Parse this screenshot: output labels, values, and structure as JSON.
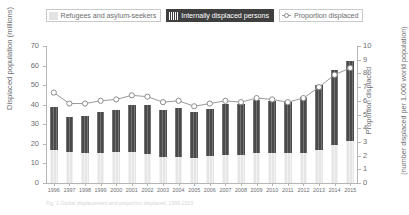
{
  "legend": {
    "items": [
      {
        "label": "Refugees and asylum-seekers",
        "style": "light",
        "swatch": "legend-swatch-refugees"
      },
      {
        "label": "Internally displaced persons",
        "style": "dark",
        "swatch": "legend-swatch-idp"
      },
      {
        "label": "Proportion displaced",
        "style": "line",
        "swatch": "legend-swatch-proportion"
      }
    ]
  },
  "colors": {
    "bar_dark": "#4a4a4a",
    "bar_light": "#e6e6e6",
    "line": "#9a9a9a",
    "marker_fill": "#ffffff",
    "marker_stroke": "#8c8c8c",
    "axis": "#b5b5b5",
    "text": "#6d6e71"
  },
  "caption": "Fig. 1 Global displacement and proportion displaced, 1996-2015",
  "chart_data": {
    "type": "bar",
    "title": "",
    "subtitle": "",
    "xlabel": "",
    "ylabel": "Displaced population  (millions)",
    "y2label_line1": "Proportion displaced",
    "y2label_line2": "(number displaced per 1,000 world population)",
    "grid": false,
    "legend_position": "top-center",
    "ylim": [
      0,
      70
    ],
    "y2lim": [
      0,
      10
    ],
    "yticks": [
      0,
      10,
      20,
      30,
      40,
      50,
      60,
      70
    ],
    "y2ticks": [
      0,
      1,
      2,
      3,
      4,
      5,
      6,
      7,
      8,
      9,
      10
    ],
    "categories": [
      "1996",
      "1997",
      "1998",
      "1999",
      "2000",
      "2001",
      "2002",
      "2003",
      "2004",
      "2005",
      "2006",
      "2007",
      "2008",
      "2009",
      "2010",
      "2011",
      "2012",
      "2013",
      "2014",
      "2015"
    ],
    "series": [
      {
        "name": "Refugees and asylum-seekers",
        "type": "bar-segment",
        "axis": "left",
        "values": [
          16.7,
          15.9,
          15.1,
          15.1,
          15.9,
          15.8,
          15.0,
          13.4,
          13.2,
          12.7,
          13.6,
          14.4,
          14.4,
          15.2,
          15.4,
          15.2,
          15.4,
          16.7,
          19.5,
          21.3
        ]
      },
      {
        "name": "Internally displaced persons",
        "type": "bar-segment",
        "axis": "left",
        "values": [
          22.1,
          18.0,
          19.2,
          21.0,
          21.2,
          24.0,
          24.8,
          23.9,
          25.3,
          23.7,
          24.4,
          26.0,
          26.0,
          27.1,
          26.6,
          26.4,
          28.8,
          33.3,
          38.2,
          40.8
        ]
      },
      {
        "name": "Total displaced",
        "type": "bar-total",
        "axis": "left",
        "values": [
          38.8,
          33.9,
          34.3,
          36.1,
          37.1,
          39.8,
          39.8,
          37.3,
          38.5,
          36.4,
          38.0,
          40.4,
          40.4,
          42.3,
          42.0,
          41.6,
          44.2,
          50.0,
          57.7,
          62.1
        ]
      },
      {
        "name": "Proportion displaced",
        "type": "line",
        "axis": "right",
        "values": [
          6.6,
          5.8,
          5.8,
          6.0,
          6.1,
          6.4,
          6.3,
          5.9,
          6.0,
          5.6,
          5.8,
          6.0,
          5.9,
          6.2,
          6.1,
          5.9,
          6.2,
          7.0,
          7.9,
          8.4
        ]
      }
    ]
  }
}
